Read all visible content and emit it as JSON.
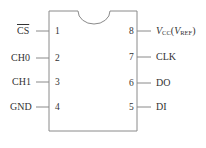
{
  "chip": {
    "colors": {
      "line": "#8a8a8a",
      "text": "#333333",
      "background": "#ffffff"
    },
    "left_pins": [
      {
        "number": "1",
        "label": "CS",
        "active_low": true
      },
      {
        "number": "2",
        "label": "CH0",
        "active_low": false
      },
      {
        "number": "3",
        "label": "CH1",
        "active_low": false
      },
      {
        "number": "4",
        "label": "GND",
        "active_low": false
      }
    ],
    "right_pins": [
      {
        "number": "8",
        "label_main": "V",
        "label_sub": "CC",
        "label_paren_main": "V",
        "label_paren_sub": "REF",
        "label": "VCC(VREF)"
      },
      {
        "number": "7",
        "label": "CLK"
      },
      {
        "number": "6",
        "label": "DO"
      },
      {
        "number": "5",
        "label": "DI"
      }
    ]
  }
}
